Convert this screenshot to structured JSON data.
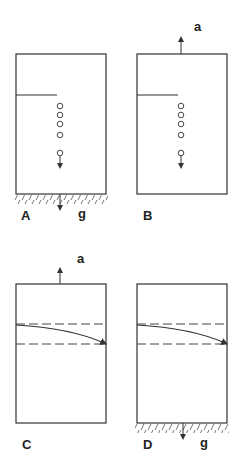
{
  "figure": {
    "panels": [
      {
        "id": "A",
        "label": "A",
        "accel_label": "",
        "gravity_label": "g",
        "support": "ground",
        "content": "drops"
      },
      {
        "id": "B",
        "label": "B",
        "accel_label": "a",
        "gravity_label": "",
        "support": "none",
        "content": "drops"
      },
      {
        "id": "C",
        "label": "C",
        "accel_label": "a",
        "gravity_label": "",
        "support": "none",
        "content": "light-beam"
      },
      {
        "id": "D",
        "label": "D",
        "accel_label": "",
        "gravity_label": "g",
        "support": "ground",
        "content": "light-beam"
      }
    ],
    "colors": {
      "stroke": "#333333",
      "background": "#ffffff"
    }
  }
}
